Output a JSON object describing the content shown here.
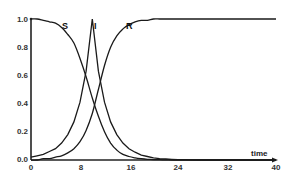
{
  "chart_data": {
    "type": "line",
    "title": "",
    "xlabel": "time",
    "ylabel": "",
    "xlim": [
      0,
      40
    ],
    "ylim": [
      0,
      1.0
    ],
    "grid": false,
    "legend": "inline labels near curves",
    "x_ticks": [
      "0",
      "8",
      "16",
      "24",
      "32",
      "40"
    ],
    "y_ticks": [
      "0.0",
      "0.2",
      "0.4",
      "0.6",
      "0.8",
      "1.0"
    ],
    "x": [
      0,
      1,
      2,
      3,
      4,
      5,
      6,
      7,
      8,
      9,
      10,
      11,
      12,
      13,
      14,
      15,
      16,
      17,
      18,
      19,
      20,
      21,
      22,
      23,
      24,
      25,
      26,
      28,
      30,
      32,
      34,
      36,
      38,
      40
    ],
    "series": [
      {
        "name": "S",
        "values": [
          1.0,
          1.0,
          0.99,
          0.98,
          0.97,
          0.94,
          0.89,
          0.83,
          0.72,
          0.59,
          0.44,
          0.31,
          0.2,
          0.12,
          0.07,
          0.04,
          0.025,
          0.015,
          0.009,
          0.005,
          0.003,
          0.002,
          0.001,
          0.0,
          0.0,
          0.0,
          0.0,
          0.0,
          0.0,
          0.0,
          0.0,
          0.0,
          0.0,
          0.0
        ]
      },
      {
        "name": "I",
        "values": [
          0.02,
          0.03,
          0.04,
          0.06,
          0.08,
          0.12,
          0.18,
          0.27,
          0.41,
          0.63,
          1.0,
          0.63,
          0.41,
          0.27,
          0.18,
          0.12,
          0.08,
          0.055,
          0.035,
          0.025,
          0.015,
          0.01,
          0.007,
          0.005,
          0.003,
          0.002,
          0.001,
          0.0,
          0.0,
          0.0,
          0.0,
          0.0,
          0.0,
          0.0
        ]
      },
      {
        "name": "R",
        "values": [
          0.0,
          0.0,
          0.01,
          0.01,
          0.02,
          0.03,
          0.05,
          0.08,
          0.13,
          0.21,
          0.33,
          0.5,
          0.67,
          0.8,
          0.88,
          0.93,
          0.96,
          0.98,
          0.99,
          0.99,
          1.0,
          1.0,
          1.0,
          1.0,
          1.0,
          1.0,
          1.0,
          1.0,
          1.0,
          1.0,
          1.0,
          1.0,
          1.0,
          1.0
        ]
      }
    ],
    "annotations": [
      {
        "text": "S",
        "x": 5.5,
        "y": 0.93
      },
      {
        "text": "I",
        "x": 10.5,
        "y": 0.93
      },
      {
        "text": "R",
        "x": 15.5,
        "y": 0.93
      }
    ]
  },
  "labels": {
    "x_axis": "time",
    "curve_S": "S",
    "curve_I": "I",
    "curve_R": "R",
    "xt0": "0",
    "xt1": "8",
    "xt2": "16",
    "xt3": "24",
    "xt4": "32",
    "xt5": "40",
    "yt0": "0.0",
    "yt1": "0.2",
    "yt2": "0.4",
    "yt3": "0.6",
    "yt4": "0.8",
    "yt5": "1.0"
  }
}
